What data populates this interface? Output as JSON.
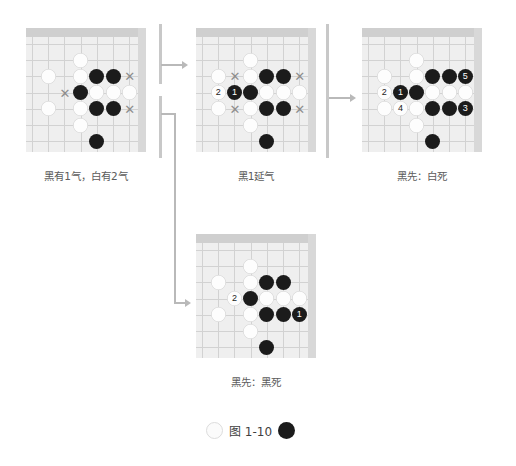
{
  "figure": {
    "label": "图 1-10",
    "left_stone_color": "white",
    "right_stone_color": "black"
  },
  "palette": {
    "board_bg": "#efefef",
    "board_band": "#cfcfcf",
    "grid_line": "#d2d2d2",
    "black_stone": "#1b1b1b",
    "white_stone": "#fdfdfd",
    "x_mark": "#8d8d8d",
    "connector": "#b9b9b9",
    "caption_text": "#5c5c5c"
  },
  "diagrams": [
    {
      "id": "diagram-1",
      "caption": "黑有1气，白有2气",
      "cols": 7,
      "rows": 7,
      "stones": [
        {
          "color": "white",
          "col": 3,
          "row": 1,
          "label": ""
        },
        {
          "color": "white",
          "col": 1,
          "row": 2,
          "label": ""
        },
        {
          "color": "white",
          "col": 3,
          "row": 2,
          "label": ""
        },
        {
          "color": "black",
          "col": 4,
          "row": 2,
          "label": ""
        },
        {
          "color": "black",
          "col": 5,
          "row": 2,
          "label": ""
        },
        {
          "color": "black",
          "col": 3,
          "row": 3,
          "label": ""
        },
        {
          "color": "white",
          "col": 4,
          "row": 3,
          "label": ""
        },
        {
          "color": "white",
          "col": 5,
          "row": 3,
          "label": ""
        },
        {
          "color": "white",
          "col": 6,
          "row": 3,
          "label": ""
        },
        {
          "color": "white",
          "col": 1,
          "row": 4,
          "label": ""
        },
        {
          "color": "white",
          "col": 3,
          "row": 4,
          "label": ""
        },
        {
          "color": "black",
          "col": 4,
          "row": 4,
          "label": ""
        },
        {
          "color": "black",
          "col": 5,
          "row": 4,
          "label": ""
        },
        {
          "color": "white",
          "col": 3,
          "row": 5,
          "label": ""
        },
        {
          "color": "black",
          "col": 4,
          "row": 6,
          "label": ""
        }
      ],
      "xmarks": [
        {
          "col": 2,
          "row": 3
        },
        {
          "col": 6,
          "row": 2
        },
        {
          "col": 6,
          "row": 4
        }
      ]
    },
    {
      "id": "diagram-2",
      "caption": "黑1延气",
      "cols": 7,
      "rows": 7,
      "stones": [
        {
          "color": "white",
          "col": 3,
          "row": 1,
          "label": ""
        },
        {
          "color": "white",
          "col": 1,
          "row": 2,
          "label": ""
        },
        {
          "color": "white",
          "col": 3,
          "row": 2,
          "label": ""
        },
        {
          "color": "black",
          "col": 4,
          "row": 2,
          "label": ""
        },
        {
          "color": "black",
          "col": 5,
          "row": 2,
          "label": ""
        },
        {
          "color": "white",
          "col": 1,
          "row": 3,
          "label": "2"
        },
        {
          "color": "black",
          "col": 2,
          "row": 3,
          "label": "1"
        },
        {
          "color": "black",
          "col": 3,
          "row": 3,
          "label": ""
        },
        {
          "color": "white",
          "col": 4,
          "row": 3,
          "label": ""
        },
        {
          "color": "white",
          "col": 5,
          "row": 3,
          "label": ""
        },
        {
          "color": "white",
          "col": 6,
          "row": 3,
          "label": ""
        },
        {
          "color": "white",
          "col": 1,
          "row": 4,
          "label": ""
        },
        {
          "color": "white",
          "col": 3,
          "row": 4,
          "label": ""
        },
        {
          "color": "black",
          "col": 4,
          "row": 4,
          "label": ""
        },
        {
          "color": "black",
          "col": 5,
          "row": 4,
          "label": ""
        },
        {
          "color": "white",
          "col": 3,
          "row": 5,
          "label": ""
        },
        {
          "color": "black",
          "col": 4,
          "row": 6,
          "label": ""
        }
      ],
      "xmarks": [
        {
          "col": 2,
          "row": 2
        },
        {
          "col": 6,
          "row": 2
        },
        {
          "col": 2,
          "row": 4
        },
        {
          "col": 6,
          "row": 4
        }
      ]
    },
    {
      "id": "diagram-3",
      "caption": "黑先：白死",
      "cols": 7,
      "rows": 7,
      "stones": [
        {
          "color": "white",
          "col": 3,
          "row": 1,
          "label": ""
        },
        {
          "color": "white",
          "col": 1,
          "row": 2,
          "label": ""
        },
        {
          "color": "white",
          "col": 3,
          "row": 2,
          "label": ""
        },
        {
          "color": "black",
          "col": 4,
          "row": 2,
          "label": ""
        },
        {
          "color": "black",
          "col": 5,
          "row": 2,
          "label": ""
        },
        {
          "color": "black",
          "col": 6,
          "row": 2,
          "label": "5"
        },
        {
          "color": "white",
          "col": 1,
          "row": 3,
          "label": "2"
        },
        {
          "color": "black",
          "col": 2,
          "row": 3,
          "label": "1"
        },
        {
          "color": "black",
          "col": 3,
          "row": 3,
          "label": ""
        },
        {
          "color": "white",
          "col": 4,
          "row": 3,
          "label": ""
        },
        {
          "color": "white",
          "col": 5,
          "row": 3,
          "label": ""
        },
        {
          "color": "white",
          "col": 6,
          "row": 3,
          "label": ""
        },
        {
          "color": "white",
          "col": 1,
          "row": 4,
          "label": ""
        },
        {
          "color": "white",
          "col": 2,
          "row": 4,
          "label": "4"
        },
        {
          "color": "white",
          "col": 3,
          "row": 4,
          "label": ""
        },
        {
          "color": "black",
          "col": 4,
          "row": 4,
          "label": ""
        },
        {
          "color": "black",
          "col": 5,
          "row": 4,
          "label": ""
        },
        {
          "color": "black",
          "col": 6,
          "row": 4,
          "label": "3"
        },
        {
          "color": "white",
          "col": 3,
          "row": 5,
          "label": ""
        },
        {
          "color": "black",
          "col": 4,
          "row": 6,
          "label": ""
        }
      ],
      "xmarks": []
    },
    {
      "id": "diagram-4",
      "caption": "黑先：黑死",
      "cols": 7,
      "rows": 7,
      "stones": [
        {
          "color": "white",
          "col": 3,
          "row": 1,
          "label": ""
        },
        {
          "color": "white",
          "col": 1,
          "row": 2,
          "label": ""
        },
        {
          "color": "white",
          "col": 3,
          "row": 2,
          "label": ""
        },
        {
          "color": "black",
          "col": 4,
          "row": 2,
          "label": ""
        },
        {
          "color": "black",
          "col": 5,
          "row": 2,
          "label": ""
        },
        {
          "color": "white",
          "col": 2,
          "row": 3,
          "label": "2"
        },
        {
          "color": "black",
          "col": 3,
          "row": 3,
          "label": ""
        },
        {
          "color": "white",
          "col": 4,
          "row": 3,
          "label": ""
        },
        {
          "color": "white",
          "col": 5,
          "row": 3,
          "label": ""
        },
        {
          "color": "white",
          "col": 6,
          "row": 3,
          "label": ""
        },
        {
          "color": "white",
          "col": 1,
          "row": 4,
          "label": ""
        },
        {
          "color": "white",
          "col": 3,
          "row": 4,
          "label": ""
        },
        {
          "color": "black",
          "col": 4,
          "row": 4,
          "label": ""
        },
        {
          "color": "black",
          "col": 5,
          "row": 4,
          "label": ""
        },
        {
          "color": "black",
          "col": 6,
          "row": 4,
          "label": "1"
        },
        {
          "color": "white",
          "col": 3,
          "row": 5,
          "label": ""
        },
        {
          "color": "black",
          "col": 4,
          "row": 6,
          "label": ""
        }
      ],
      "xmarks": []
    }
  ]
}
